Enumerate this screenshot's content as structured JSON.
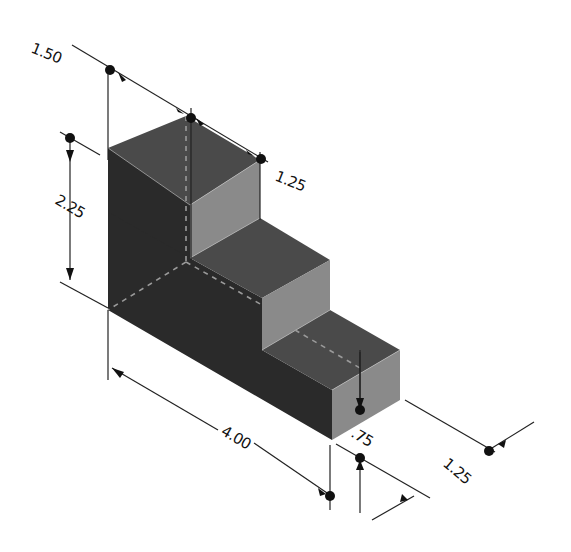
{
  "drawing": {
    "title": "Isometric stepped block with dimensions",
    "colors": {
      "background": "#ffffff",
      "top_face": "#4a4a4a",
      "left_face": "#2a2a2a",
      "front_face": "#8a8a8a",
      "hidden_line": "#9a9a9a",
      "dimension_line": "#222222",
      "leader_dot": "#111111"
    },
    "dimensions": {
      "overall_depth_top": "1.50",
      "top_step_depth": "1.25",
      "height_top_step": "2.25",
      "overall_length": "4.00",
      "bottom_step_height": ".75",
      "bottom_step_width": "1.25"
    }
  }
}
